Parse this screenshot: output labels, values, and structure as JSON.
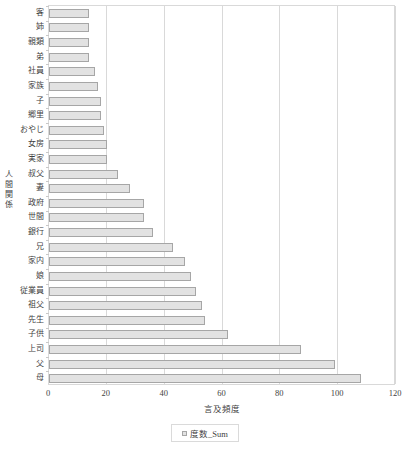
{
  "chart_data": {
    "type": "bar",
    "orientation": "horizontal",
    "title": "",
    "xlabel": "言及頻度",
    "ylabel": "人間関係",
    "xlim": [
      0,
      120
    ],
    "xticks": [
      "0",
      "20",
      "40",
      "60",
      "80",
      "100",
      "120"
    ],
    "grid": true,
    "legend_position": "bottom",
    "legend": [
      "度数_Sum"
    ],
    "series_name": "度数_Sum",
    "categories": [
      "客",
      "姉",
      "親類",
      "弟",
      "社員",
      "家族",
      "子",
      "郷里",
      "おやじ",
      "女房",
      "実家",
      "叔父",
      "妻",
      "政府",
      "世間",
      "銀行",
      "兄",
      "家内",
      "娘",
      "従業員",
      "祖父",
      "先生",
      "子供",
      "上司",
      "父",
      "母"
    ],
    "values": [
      14,
      14,
      14,
      14,
      16,
      17,
      18,
      18,
      19,
      20,
      20,
      24,
      28,
      33,
      33,
      36,
      43,
      47,
      49,
      51,
      53,
      54,
      62,
      87,
      99,
      108
    ],
    "colors": {
      "bar_fill": "#e2e2e2",
      "bar_border": "#a6a6a6",
      "gridline": "#d9d9d9",
      "text": "#3f3f3f"
    }
  }
}
